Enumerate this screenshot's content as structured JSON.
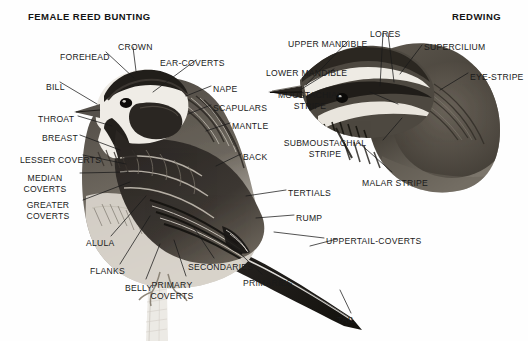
{
  "figure": {
    "background_color": "#fefefe",
    "text_color": "#1a1a1a"
  },
  "panels": [
    {
      "id": "left",
      "title": "FEMALE REED BUNTING",
      "subject": "female-reed-bunting"
    },
    {
      "id": "right",
      "title": "REDWING",
      "subject": "redwing"
    }
  ],
  "labels": {
    "bunting": [
      {
        "name": "forehead",
        "lines": [
          "FOREHEAD"
        ],
        "x": 60,
        "y": 52,
        "align": "left"
      },
      {
        "name": "crown",
        "lines": [
          "CROWN"
        ],
        "x": 118,
        "y": 42,
        "align": "left"
      },
      {
        "name": "ear-coverts",
        "lines": [
          "EAR-COVERTS"
        ],
        "x": 160,
        "y": 58,
        "align": "left"
      },
      {
        "name": "bill",
        "lines": [
          "BILL"
        ],
        "x": 46,
        "y": 82,
        "align": "left"
      },
      {
        "name": "nape",
        "lines": [
          "NAPE"
        ],
        "x": 213,
        "y": 84,
        "align": "left"
      },
      {
        "name": "scapulars",
        "lines": [
          "SCAPULARS"
        ],
        "x": 213,
        "y": 103,
        "align": "left"
      },
      {
        "name": "throat",
        "lines": [
          "THROAT"
        ],
        "x": 38,
        "y": 114,
        "align": "left"
      },
      {
        "name": "mantle",
        "lines": [
          "MANTLE"
        ],
        "x": 232,
        "y": 121,
        "align": "left"
      },
      {
        "name": "breast",
        "lines": [
          "BREAST"
        ],
        "x": 42,
        "y": 133,
        "align": "left"
      },
      {
        "name": "lesser-coverts",
        "lines": [
          "LESSER COVERTS"
        ],
        "x": 20,
        "y": 155,
        "align": "left"
      },
      {
        "name": "back",
        "lines": [
          "BACK"
        ],
        "x": 243,
        "y": 152,
        "align": "left"
      },
      {
        "name": "median-coverts",
        "lines": [
          "MEDIAN",
          "COVERTS"
        ],
        "x": 45,
        "y": 173,
        "align": "center"
      },
      {
        "name": "tertials",
        "lines": [
          "TERTIALS"
        ],
        "x": 288,
        "y": 188,
        "align": "left"
      },
      {
        "name": "greater-coverts",
        "lines": [
          "GREATER",
          "COVERTS"
        ],
        "x": 48,
        "y": 200,
        "align": "center"
      },
      {
        "name": "rump",
        "lines": [
          "RUMP"
        ],
        "x": 296,
        "y": 213,
        "align": "left"
      },
      {
        "name": "alula",
        "lines": [
          "ALULA"
        ],
        "x": 86,
        "y": 238,
        "align": "left"
      },
      {
        "name": "uppertail-coverts",
        "lines": [
          "UPPERTAIL-COVERTS"
        ],
        "x": 326,
        "y": 236,
        "align": "left"
      },
      {
        "name": "flanks",
        "lines": [
          "FLANKS"
        ],
        "x": 90,
        "y": 266,
        "align": "left"
      },
      {
        "name": "secondaries",
        "lines": [
          "SECONDARIES"
        ],
        "x": 188,
        "y": 262,
        "align": "left"
      },
      {
        "name": "belly",
        "lines": [
          "BELLY"
        ],
        "x": 125,
        "y": 283,
        "align": "left"
      },
      {
        "name": "primary-coverts",
        "lines": [
          "PRIMARY",
          "COVERTS"
        ],
        "x": 172,
        "y": 280,
        "align": "center"
      },
      {
        "name": "primaries",
        "lines": [
          "PRIMARIES"
        ],
        "x": 243,
        "y": 278,
        "align": "left"
      }
    ],
    "redwing": [
      {
        "name": "upper-mandible",
        "lines": [
          "UPPER MANDIBLE"
        ],
        "x": 288,
        "y": 39,
        "align": "left"
      },
      {
        "name": "lores",
        "lines": [
          "LORES"
        ],
        "x": 370,
        "y": 29,
        "align": "left"
      },
      {
        "name": "supercilium",
        "lines": [
          "SUPERCILIUM"
        ],
        "x": 424,
        "y": 42,
        "align": "left"
      },
      {
        "name": "lower-mandible",
        "lines": [
          "LOWER MANDIBLE"
        ],
        "x": 266,
        "y": 68,
        "align": "left"
      },
      {
        "name": "eye-stripe",
        "lines": [
          "EYE-STRIPE"
        ],
        "x": 470,
        "y": 72,
        "align": "left"
      },
      {
        "name": "moustachial-stripe",
        "lines": [
          "MOUSTACHIAL",
          "STRIPE"
        ],
        "x": 310,
        "y": 90,
        "align": "center"
      },
      {
        "name": "submoustachial-stripe",
        "lines": [
          "SUBMOUSTACHIAL",
          "STRIPE"
        ],
        "x": 325,
        "y": 138,
        "align": "center"
      },
      {
        "name": "malar-stripe",
        "lines": [
          "MALAR STRIPE"
        ],
        "x": 362,
        "y": 178,
        "align": "left"
      },
      {
        "name": "tail",
        "lines": [
          "TAIL"
        ],
        "x": 337,
        "y": 315,
        "align": "left"
      }
    ]
  }
}
